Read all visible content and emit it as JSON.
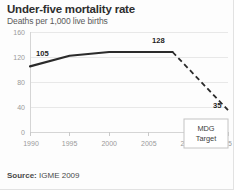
{
  "header": {
    "title": "Under-five mortality rate",
    "subtitle": "Deaths per 1,000 live births"
  },
  "footer": {
    "source_label": "Source:",
    "source_value": "IGME 2009"
  },
  "annotation": {
    "line1": "MDG",
    "line2": "Target"
  },
  "colors": {
    "line": "#2b2b2b",
    "grid": "#e8e8e8",
    "tick_text": "#9a9a9a",
    "title_text": "#2e2e2e",
    "subtitle_text": "#5a5a5a"
  },
  "chart_data": {
    "type": "line",
    "title": "Under-five mortality rate",
    "subtitle": "Deaths per 1,000 live births",
    "xlabel": "",
    "ylabel": "Deaths per 1,000 live births",
    "xlim": [
      1990,
      2015
    ],
    "ylim": [
      0,
      160
    ],
    "yticks": [
      0,
      40,
      80,
      120,
      160
    ],
    "xticks": [
      1990,
      1995,
      2000,
      2005,
      2010,
      2015
    ],
    "grid": true,
    "legend": "none",
    "series": [
      {
        "name": "Observed",
        "style": "solid",
        "x": [
          1990,
          1995,
          2000,
          2005,
          2008
        ],
        "values": [
          105,
          122,
          128,
          128,
          128
        ]
      },
      {
        "name": "MDG trajectory",
        "style": "dashed",
        "x": [
          2008,
          2015
        ],
        "values": [
          128,
          35
        ]
      }
    ],
    "annotations": [
      {
        "text": "105",
        "x": 1990,
        "y": 105
      },
      {
        "text": "128",
        "x": 2008,
        "y": 128
      },
      {
        "text": "35",
        "x": 2015,
        "y": 35
      },
      {
        "text": "MDG Target",
        "x": 2013.2,
        "y": 22
      }
    ]
  }
}
